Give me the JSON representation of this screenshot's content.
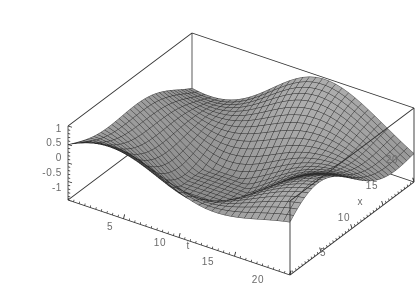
{
  "figure": {
    "kind": "mathematica-plot3d",
    "background": "#ffffff",
    "frame_color": "#303030",
    "mesh_color": "#232323",
    "label_color": "#6b6b6b",
    "face_light": "#c9c9c9",
    "face_dark": "#6e6e6e"
  },
  "chart_data": {
    "type": "surface",
    "title": "",
    "xlabel": "t",
    "ylabel": "x",
    "zlabel": "",
    "grid": false,
    "legend": null,
    "axes": {
      "t": {
        "label": "t",
        "min": 0,
        "max": 20,
        "ticks": [
          5,
          10,
          15,
          20
        ],
        "tick_labels": [
          "5",
          "10",
          "15",
          "20"
        ]
      },
      "x": {
        "label": "x",
        "min": 0,
        "max": 20,
        "ticks": [
          5,
          10,
          15,
          20
        ],
        "tick_labels": [
          "5",
          "10",
          "15",
          "20"
        ]
      },
      "z": {
        "label": "",
        "min": -1,
        "max": 1,
        "ticks": [
          1,
          0.5,
          0,
          -0.5,
          -1
        ],
        "tick_labels": [
          "1",
          "0.5",
          "0",
          "-0.5",
          "-1"
        ]
      }
    },
    "surface": {
      "description": "travelling-wave packet z(t,x)",
      "t_samples": 34,
      "x_samples": 34,
      "z_range": [
        -1,
        1
      ],
      "terms": [
        {
          "amp": 0.62,
          "kt": 0.2827,
          "kx": 0.1571,
          "phase": 1.05
        },
        {
          "amp": 0.4,
          "kt": 0.1571,
          "kx": -0.3142,
          "phase": -0.45
        },
        {
          "amp": 0.26,
          "kt": -0.0785,
          "kx": 0.2356,
          "phase": 2.1
        }
      ]
    },
    "projection": {
      "top_corner": [
        192,
        33
      ],
      "right_corner": [
        378,
        82
      ],
      "left_corner": [
        68,
        126
      ],
      "front_corner": [
        290,
        275
      ],
      "z_axis_top": [
        70,
        128
      ],
      "z_axis_bottom": [
        76,
        200
      ],
      "box_height_px": 74
    }
  },
  "labels": {
    "z_ticks": [
      {
        "text": "1",
        "x": 62,
        "y": 129
      },
      {
        "text": "0.5",
        "x": 62,
        "y": 143
      },
      {
        "text": "0",
        "x": 62,
        "y": 158
      },
      {
        "text": "-0.5",
        "x": 62,
        "y": 173
      },
      {
        "text": "-1",
        "x": 62,
        "y": 188
      }
    ],
    "t_ticks": [
      {
        "text": "5",
        "x": 110,
        "y": 227
      },
      {
        "text": "10",
        "x": 160,
        "y": 243
      },
      {
        "text": "15",
        "x": 208,
        "y": 262
      },
      {
        "text": "20",
        "x": 258,
        "y": 280
      }
    ],
    "x_ticks": [
      {
        "text": "5",
        "x": 323,
        "y": 253
      },
      {
        "text": "10",
        "x": 344,
        "y": 218
      },
      {
        "text": "15",
        "x": 372,
        "y": 186
      },
      {
        "text": "20",
        "x": 392,
        "y": 160
      }
    ],
    "t_axis_title": {
      "text": "t",
      "x": 188,
      "y": 246
    },
    "x_axis_title": {
      "text": "x",
      "x": 360,
      "y": 202
    }
  }
}
